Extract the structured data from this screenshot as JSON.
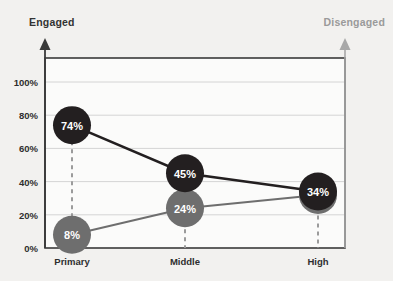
{
  "header": {
    "left_label": "Engaged",
    "right_label": "Disengaged"
  },
  "colors": {
    "engaged": "#231f20",
    "disengaged": "#6e6e6e",
    "axis_left": "#3a3a3a",
    "axis_right": "#a8a8a8",
    "gridline": "#d4d4d4",
    "plot_border": "#3a3a3a",
    "background": "#f2f1ef",
    "plot_background": "#fbfbfa",
    "label_dark": "#2e2e2e",
    "label_light": "#9a9a9a"
  },
  "y_axis": {
    "ticks": [
      "0%",
      "20%",
      "40%",
      "60%",
      "80%",
      "100%"
    ],
    "values": [
      0,
      20,
      40,
      60,
      80,
      100
    ]
  },
  "x_axis": {
    "categories": [
      "Primary",
      "Middle",
      "High"
    ]
  },
  "points": {
    "engaged": [
      "74%",
      "45%",
      "34%"
    ],
    "disengaged": [
      "8%",
      "24%",
      "32%"
    ]
  },
  "chart_data": {
    "type": "line",
    "title": "",
    "subtitle": "",
    "xlabel": "",
    "ylabel": "",
    "categories": [
      "Primary",
      "Middle",
      "High"
    ],
    "series": [
      {
        "name": "Engaged",
        "color": "#231f20",
        "values": [
          74,
          45,
          34
        ],
        "labels": [
          "74%",
          "45%",
          "34%"
        ],
        "marker": "circle-filled"
      },
      {
        "name": "Disengaged",
        "color": "#6e6e6e",
        "values": [
          8,
          24,
          32
        ],
        "labels": [
          "8%",
          "24%",
          "32%"
        ],
        "marker": "circle-filled"
      }
    ],
    "ylim": [
      0,
      100
    ],
    "ytick_labels": [
      "0%",
      "20%",
      "40%",
      "60%",
      "80%",
      "100%"
    ],
    "ytick_values": [
      0,
      20,
      40,
      60,
      80,
      100
    ],
    "grid": "horizontal",
    "legend": "none",
    "annotations": [
      "Engaged label above left axis",
      "Disengaged label above right axis",
      "dashed vertical drop lines at each category"
    ]
  }
}
